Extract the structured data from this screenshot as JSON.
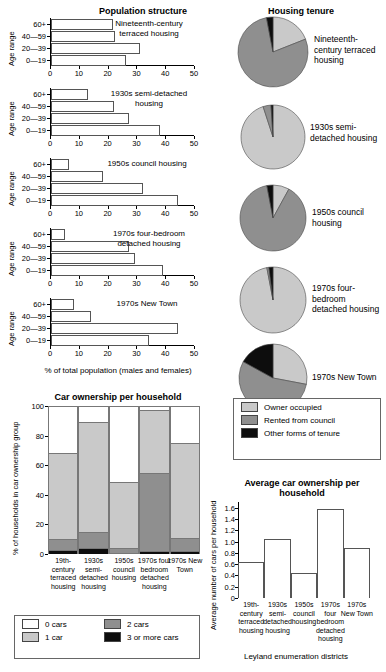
{
  "population": {
    "title": "Population structure",
    "y_axis_label": "Age range",
    "x_axis_label": "% of total population (males and females)",
    "age_groups": [
      "60+",
      "40—59",
      "20—39",
      "0—19"
    ],
    "x_ticks": [
      0,
      10,
      20,
      30,
      40,
      50
    ],
    "panels": [
      {
        "name": "Nineteenth-century terraced housing",
        "values": [
          21.5,
          22.3,
          31.0,
          26.0
        ]
      },
      {
        "name": "1930s semi-detached housing",
        "values": [
          13.0,
          22.0,
          27.0,
          38.0
        ]
      },
      {
        "name": "1950s council housing",
        "values": [
          6.2,
          18.0,
          32.0,
          44.0
        ]
      },
      {
        "name": "1970s four-bedroom detached housing",
        "values": [
          5.0,
          27.0,
          29.0,
          39.0
        ]
      },
      {
        "name": "1970s New Town",
        "values": [
          8.0,
          14.0,
          44.0,
          34.0
        ]
      }
    ]
  },
  "tenure": {
    "title": "Housing tenure",
    "legend": [
      {
        "label": "Owner occupied",
        "color": "#c9c9c9"
      },
      {
        "label": "Rented from council",
        "color": "#8f8f8f"
      },
      {
        "label": "Other forms of tenure",
        "color": "#0d0d0d"
      }
    ],
    "pies": [
      {
        "name": "Nineteenth-century terraced housing",
        "values": [
          19,
          78,
          3
        ]
      },
      {
        "name": "1930s semi-detached housing",
        "values": [
          95,
          4,
          1
        ]
      },
      {
        "name": "1950s council housing",
        "values": [
          8,
          89,
          3
        ]
      },
      {
        "name": "1970s four-bedroom detached housing",
        "values": [
          97,
          1,
          2
        ]
      },
      {
        "name": "1970s New Town",
        "values": [
          28,
          55,
          17
        ]
      }
    ]
  },
  "car_ownership": {
    "title": "Car ownership per household",
    "y_axis_label": "% of households in car ownership group",
    "y_ticks": [
      0,
      20,
      40,
      60,
      80,
      100
    ],
    "categories": [
      "19th-century terraced housing",
      "1930s semi-detached housing",
      "1950s council housing",
      "1970s four bedroom detached housing",
      "1970s New Town"
    ],
    "legend": [
      {
        "label": "0 cars",
        "color": "#ffffff"
      },
      {
        "label": "1 car",
        "color": "#c9c9c9"
      },
      {
        "label": "2 cars",
        "color": "#8f8f8f"
      },
      {
        "label": "3 or more cars",
        "color": "#0d0d0d"
      }
    ],
    "series": [
      {
        "name": "0 cars",
        "values": [
          32,
          11,
          51,
          3,
          25
        ]
      },
      {
        "name": "1 car",
        "values": [
          58,
          74,
          45,
          42,
          64
        ]
      },
      {
        "name": "2 cars",
        "values": [
          7,
          11,
          3,
          53,
          9
        ]
      },
      {
        "name": "3 or more cars",
        "values": [
          3,
          4,
          1,
          2,
          2
        ]
      }
    ]
  },
  "average_cars": {
    "title": "Average car ownership per household",
    "y_axis_label": "Average number of cars per household",
    "x_axis_label": "Leyland enumeration districts",
    "y_ticks": [
      0,
      0.2,
      0.4,
      0.6,
      0.8,
      1.0,
      1.2,
      1.4,
      1.6
    ],
    "categories": [
      "19th-century terraced housing",
      "1930s semi-detached housing",
      "1950s council housing",
      "1970s four bedroom detached housing",
      "1970s New Town"
    ],
    "values": [
      0.63,
      1.04,
      0.44,
      1.58,
      0.88
    ]
  },
  "chart_data": {
    "type": "bar",
    "panels": [
      {
        "type": "bar",
        "orientation": "horizontal",
        "title": "Population structure",
        "xlabel": "% of total population (males and females)",
        "ylabel": "Age range",
        "xlim": [
          0,
          50
        ],
        "categories": [
          "60+",
          "40—59",
          "20—39",
          "0—19"
        ],
        "series": [
          {
            "name": "Nineteenth-century terraced housing",
            "values": [
              21.5,
              22.3,
              31.0,
              26.0
            ]
          },
          {
            "name": "1930s semi-detached housing",
            "values": [
              13.0,
              22.0,
              27.0,
              38.0
            ]
          },
          {
            "name": "1950s council housing",
            "values": [
              6.2,
              18.0,
              32.0,
              44.0
            ]
          },
          {
            "name": "1970s four-bedroom detached housing",
            "values": [
              5.0,
              27.0,
              29.0,
              39.0
            ]
          },
          {
            "name": "1970s New Town",
            "values": [
              8.0,
              14.0,
              44.0,
              34.0
            ]
          }
        ]
      },
      {
        "type": "pie",
        "title": "Housing tenure",
        "legend": [
          "Owner occupied",
          "Rented from council",
          "Other forms of tenure"
        ],
        "pies": [
          {
            "name": "Nineteenth-century terraced housing",
            "values": [
              19,
              78,
              3
            ]
          },
          {
            "name": "1930s semi-detached housing",
            "values": [
              95,
              4,
              1
            ]
          },
          {
            "name": "1950s council housing",
            "values": [
              8,
              89,
              3
            ]
          },
          {
            "name": "1970s four-bedroom detached housing",
            "values": [
              97,
              1,
              2
            ]
          },
          {
            "name": "1970s New Town",
            "values": [
              28,
              55,
              17
            ]
          }
        ]
      },
      {
        "type": "bar",
        "stacked": true,
        "title": "Car ownership per household",
        "ylabel": "% of households in car ownership group",
        "ylim": [
          0,
          100
        ],
        "categories": [
          "19th-century terraced housing",
          "1930s semi-detached housing",
          "1950s council housing",
          "1970s four bedroom detached housing",
          "1970s New Town"
        ],
        "series": [
          {
            "name": "0 cars",
            "values": [
              32,
              11,
              51,
              3,
              25
            ]
          },
          {
            "name": "1 car",
            "values": [
              58,
              74,
              45,
              42,
              64
            ]
          },
          {
            "name": "2 cars",
            "values": [
              7,
              11,
              3,
              53,
              9
            ]
          },
          {
            "name": "3 or more cars",
            "values": [
              3,
              4,
              1,
              2,
              2
            ]
          }
        ]
      },
      {
        "type": "bar",
        "title": "Average car ownership per household",
        "ylabel": "Average number of cars per household",
        "xlabel": "Leyland enumeration districts",
        "ylim": [
          0,
          1.7
        ],
        "categories": [
          "19th-century terraced housing",
          "1930s semi-detached housing",
          "1950s council housing",
          "1970s four bedroom detached housing",
          "1970s New Town"
        ],
        "values": [
          0.63,
          1.04,
          0.44,
          1.58,
          0.88
        ]
      }
    ]
  }
}
